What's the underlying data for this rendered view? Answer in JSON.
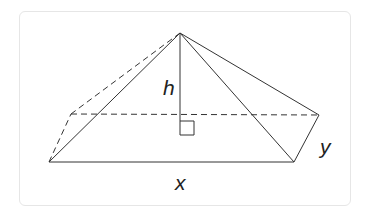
{
  "diagram": {
    "type": "rectangular-pyramid",
    "labels": {
      "height": "h",
      "base_length": "x",
      "base_width": "y"
    },
    "colors": {
      "line": "#333333",
      "border": "#e6e6e6"
    },
    "annotations": [
      "right-angle marker at base of height"
    ]
  }
}
